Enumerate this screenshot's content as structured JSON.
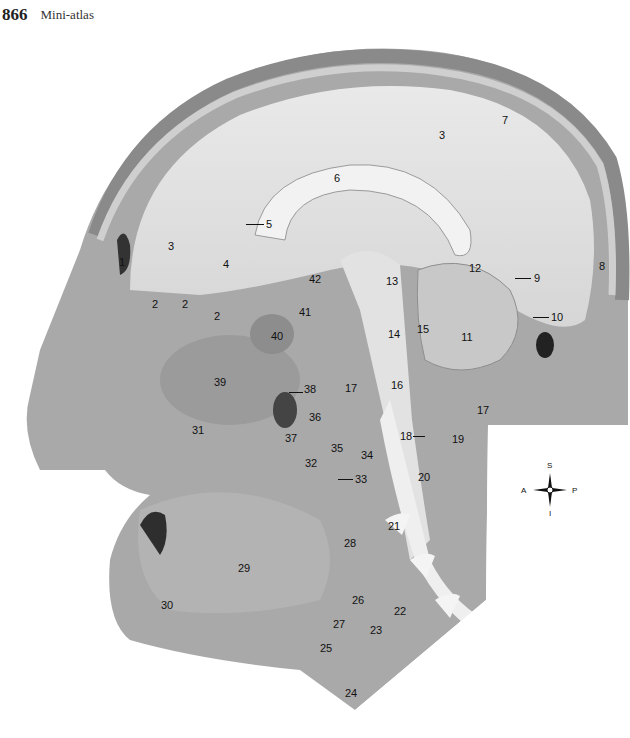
{
  "header": {
    "page_number": "866",
    "running_head": "Mini-atlas"
  },
  "figure": {
    "labels": [
      {
        "id": "1",
        "x": 122,
        "y": 262
      },
      {
        "id": "2",
        "x": 155,
        "y": 304
      },
      {
        "id": "2",
        "x": 185,
        "y": 304
      },
      {
        "id": "2",
        "x": 217,
        "y": 316
      },
      {
        "id": "3",
        "x": 171,
        "y": 246
      },
      {
        "id": "3",
        "x": 442,
        "y": 135
      },
      {
        "id": "4",
        "x": 226,
        "y": 264
      },
      {
        "id": "5",
        "x": 269,
        "y": 224
      },
      {
        "id": "6",
        "x": 337,
        "y": 178
      },
      {
        "id": "7",
        "x": 505,
        "y": 120
      },
      {
        "id": "8",
        "x": 602,
        "y": 266
      },
      {
        "id": "9",
        "x": 537,
        "y": 278
      },
      {
        "id": "10",
        "x": 557,
        "y": 317
      },
      {
        "id": "11",
        "x": 467,
        "y": 337
      },
      {
        "id": "12",
        "x": 475,
        "y": 268
      },
      {
        "id": "13",
        "x": 392,
        "y": 281
      },
      {
        "id": "14",
        "x": 394,
        "y": 334
      },
      {
        "id": "15",
        "x": 423,
        "y": 329
      },
      {
        "id": "16",
        "x": 397,
        "y": 385
      },
      {
        "id": "17",
        "x": 351,
        "y": 388
      },
      {
        "id": "17",
        "x": 483,
        "y": 410
      },
      {
        "id": "18",
        "x": 406,
        "y": 436
      },
      {
        "id": "19",
        "x": 458,
        "y": 439
      },
      {
        "id": "20",
        "x": 424,
        "y": 477
      },
      {
        "id": "21",
        "x": 394,
        "y": 526
      },
      {
        "id": "22",
        "x": 400,
        "y": 611
      },
      {
        "id": "23",
        "x": 376,
        "y": 630
      },
      {
        "id": "24",
        "x": 351,
        "y": 693
      },
      {
        "id": "25",
        "x": 326,
        "y": 648
      },
      {
        "id": "26",
        "x": 358,
        "y": 600
      },
      {
        "id": "27",
        "x": 339,
        "y": 624
      },
      {
        "id": "28",
        "x": 350,
        "y": 543
      },
      {
        "id": "29",
        "x": 244,
        "y": 568
      },
      {
        "id": "30",
        "x": 167,
        "y": 605
      },
      {
        "id": "31",
        "x": 198,
        "y": 430
      },
      {
        "id": "32",
        "x": 311,
        "y": 463
      },
      {
        "id": "33",
        "x": 361,
        "y": 479
      },
      {
        "id": "34",
        "x": 367,
        "y": 455
      },
      {
        "id": "35",
        "x": 337,
        "y": 448
      },
      {
        "id": "36",
        "x": 315,
        "y": 417
      },
      {
        "id": "37",
        "x": 291,
        "y": 438
      },
      {
        "id": "38",
        "x": 310,
        "y": 389
      },
      {
        "id": "39",
        "x": 220,
        "y": 382
      },
      {
        "id": "40",
        "x": 277,
        "y": 336
      },
      {
        "id": "41",
        "x": 305,
        "y": 312
      },
      {
        "id": "42",
        "x": 315,
        "y": 279
      }
    ]
  },
  "compass": {
    "superior": "S",
    "inferior": "I",
    "anterior": "A",
    "posterior": "P"
  },
  "caption": {
    "text": ""
  }
}
